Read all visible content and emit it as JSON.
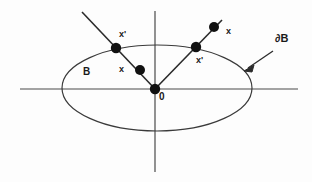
{
  "figure": {
    "background_color": "#fdfdfd",
    "stroke_color": "#3a3a3a",
    "ink_color": "#1a1a1a",
    "width": 312,
    "height": 182
  },
  "axes": {
    "horizontal": {
      "x1": 20,
      "y1": 89,
      "x2": 298,
      "y2": 89
    },
    "vertical": {
      "x1": 155,
      "y1": 11,
      "x2": 155,
      "y2": 172
    }
  },
  "ellipse": {
    "name": "region-B",
    "cx": 157,
    "cy": 88,
    "rx": 95,
    "ry": 43
  },
  "rays": [
    {
      "name": "left-ray",
      "x1": 82,
      "y1": 12,
      "x2": 155,
      "y2": 89
    },
    {
      "name": "right-ray",
      "x1": 155,
      "y1": 89,
      "x2": 222,
      "y2": 20
    }
  ],
  "points": [
    {
      "name": "origin-point",
      "cx": 155,
      "cy": 89,
      "r": 5.2
    },
    {
      "name": "left-boundary-point",
      "cx": 116,
      "cy": 48,
      "r": 5.2
    },
    {
      "name": "left-inner-point",
      "cx": 140,
      "cy": 70,
      "r": 5.0
    },
    {
      "name": "right-boundary-point",
      "cx": 196,
      "cy": 47,
      "r": 5.2
    },
    {
      "name": "right-outer-point",
      "cx": 214,
      "cy": 27,
      "r": 5.0
    }
  ],
  "arrow": {
    "name": "boundary-pointer-arrow",
    "x1": 273,
    "y1": 51,
    "x2": 245,
    "y2": 70
  },
  "labels": {
    "origin": "0",
    "region": "B",
    "boundary": "∂B",
    "left_boundary_point": "x'",
    "left_inner_point": "x",
    "right_boundary_point": "x'",
    "right_outer_point": "x"
  },
  "label_positions": {
    "origin": {
      "left": 159,
      "top": 92
    },
    "region": {
      "left": 83,
      "top": 67
    },
    "boundary": {
      "left": 275,
      "top": 33
    },
    "left_boundary_point": {
      "left": 119,
      "top": 30
    },
    "left_inner_point": {
      "left": 119,
      "top": 65
    },
    "right_boundary_point": {
      "left": 196,
      "top": 56
    },
    "right_outer_point": {
      "left": 226,
      "top": 27
    }
  }
}
